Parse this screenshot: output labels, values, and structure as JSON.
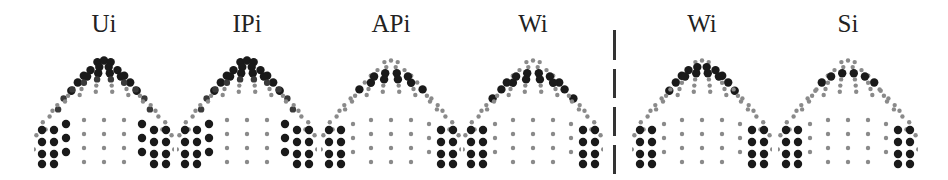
{
  "figure": {
    "divider": {
      "style": "dashed-vertical",
      "color": "#333333"
    },
    "dot_colors": {
      "strong": "#1a1a1a",
      "medium": "#3a3a3a",
      "weak": "#8a8a8a"
    },
    "panels": [
      {
        "label": "Ui",
        "center_x": 104,
        "group": "left"
      },
      {
        "label": "IPi",
        "center_x": 247,
        "group": "left"
      },
      {
        "label": "APi",
        "center_x": 391,
        "group": "left"
      },
      {
        "label": "Wi",
        "center_x": 533,
        "group": "left"
      },
      {
        "label": "Wi",
        "center_x": 702,
        "group": "right"
      },
      {
        "label": "Si",
        "center_x": 848,
        "group": "right"
      }
    ]
  }
}
